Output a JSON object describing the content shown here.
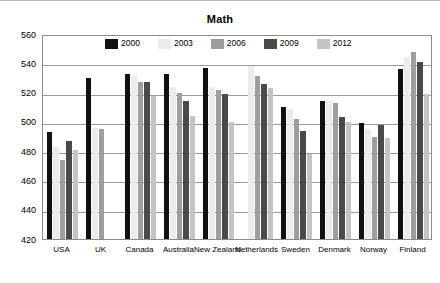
{
  "chart_data": {
    "type": "bar",
    "title": "Math",
    "xlabel": "",
    "ylabel": "",
    "ylim": [
      420,
      560
    ],
    "ytick_step": 20,
    "yticks": [
      "560",
      "540",
      "520",
      "500",
      "480",
      "460",
      "440",
      "420"
    ],
    "grid": true,
    "legend_position": "top-center",
    "categories": [
      "USA",
      "UK",
      "Canada",
      "Australia",
      "New Zealand",
      "Netherlands",
      "Sweden",
      "Denmark",
      "Norway",
      "Finland"
    ],
    "series": [
      {
        "name": "2000",
        "color": "#111111",
        "values": [
          493,
          530,
          533,
          533,
          537,
          null,
          510,
          514,
          499,
          536
        ]
      },
      {
        "name": "2003",
        "color": "#ececec",
        "values": [
          483,
          496,
          532,
          524,
          524,
          538,
          509,
          514,
          495,
          544
        ]
      },
      {
        "name": "2006",
        "color": "#9e9e9e",
        "values": [
          474,
          495,
          527,
          520,
          522,
          531,
          502,
          513,
          490,
          548
        ]
      },
      {
        "name": "2009",
        "color": "#4a4a4a",
        "values": [
          487,
          null,
          527,
          514,
          519,
          526,
          494,
          503,
          498,
          541
        ]
      },
      {
        "name": "2012",
        "color": "#c4c4c4",
        "values": [
          481,
          null,
          518,
          504,
          500,
          523,
          478,
          500,
          489,
          519
        ]
      }
    ]
  }
}
